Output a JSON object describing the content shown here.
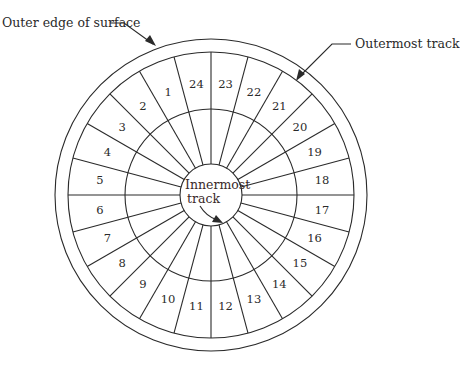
{
  "diagram": {
    "callouts": {
      "outer_edge": "Outer edge of surface",
      "outermost_track": "Outermost track",
      "innermost_line1": "Innermost",
      "innermost_line2": "track"
    },
    "sector_count": 24,
    "sectors": [
      "1",
      "2",
      "3",
      "4",
      "5",
      "6",
      "7",
      "8",
      "9",
      "10",
      "11",
      "12",
      "13",
      "14",
      "15",
      "16",
      "17",
      "18",
      "19",
      "20",
      "21",
      "22",
      "23",
      "24"
    ],
    "geometry": {
      "center": [
        211,
        195
      ],
      "outer_surface_radius": 156,
      "outermost_track_radius": 143,
      "middle_track_radius": 86,
      "innermost_track_radius": 31,
      "label_radius": 112
    },
    "colors": {
      "line": "#2a2a2a",
      "background": "#ffffff"
    }
  }
}
